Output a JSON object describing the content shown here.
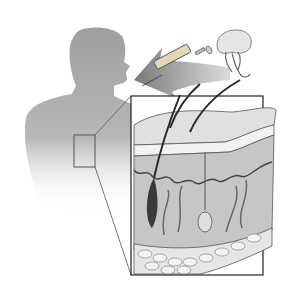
{
  "figure": {
    "colors": {
      "background": "#ffffff",
      "silhouette": "#a9a9a9",
      "silhouette_light": "#cfcfcf",
      "arrow": "#8c8c8c",
      "outline": "#222222",
      "epidermis": "#d8d8d8",
      "dermis": "#bdbdbd",
      "fat": "#e4e4e4",
      "hair": "#2a2a2a"
    },
    "elements": [
      {
        "name": "human-torso-silhouette"
      },
      {
        "name": "torso-inset-box"
      },
      {
        "name": "syringe"
      },
      {
        "name": "jellyfish"
      },
      {
        "name": "injection-arrow"
      },
      {
        "name": "skin-cross-section-inset"
      }
    ]
  }
}
